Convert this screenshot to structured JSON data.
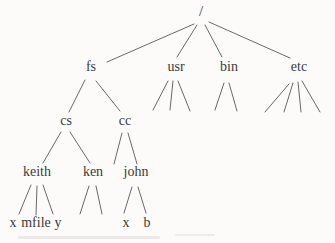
{
  "figure": {
    "type": "tree-diagram"
  },
  "nodes": {
    "root": {
      "label": "/",
      "children": [
        "fs",
        "usr",
        "bin",
        "etc"
      ]
    },
    "fs": {
      "label": "fs",
      "children": [
        "cs",
        "cc"
      ]
    },
    "usr": {
      "label": "usr",
      "unlabeled_children": 3
    },
    "bin": {
      "label": "bin",
      "unlabeled_children": 2
    },
    "etc": {
      "label": "etc",
      "unlabeled_children": 4
    },
    "cs": {
      "label": "cs",
      "children": [
        "keith",
        "ken"
      ]
    },
    "cc": {
      "label": "cc",
      "children": [
        "john"
      ],
      "unlabeled_children": 1
    },
    "keith": {
      "label": "keith",
      "children": [
        "keith_x",
        "keith_mfile",
        "keith_y"
      ]
    },
    "ken": {
      "label": "ken",
      "unlabeled_children": 2
    },
    "john": {
      "label": "john",
      "children": [
        "john_x",
        "john_b"
      ]
    },
    "keith_x": {
      "label": "x"
    },
    "keith_mfile": {
      "label": "mfile"
    },
    "keith_y": {
      "label": "y"
    },
    "john_x": {
      "label": "x"
    },
    "john_b": {
      "label": "b"
    }
  },
  "style": {
    "line_color": "#696969",
    "text_color": "#3c3b39",
    "background_color": "#fcfbf9"
  }
}
